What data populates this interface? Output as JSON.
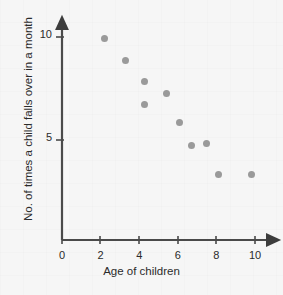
{
  "chart_data": {
    "type": "scatter",
    "title": "",
    "xlabel": "Age of children",
    "ylabel": "No. of times a child falls over in a month",
    "xlim": [
      0,
      11
    ],
    "ylim": [
      0,
      10.6
    ],
    "xticks": [
      0,
      2,
      4,
      6,
      8,
      10
    ],
    "xtick_labels": [
      "0",
      "2",
      "4",
      "6",
      "8",
      "10"
    ],
    "yticks": [
      5,
      10
    ],
    "ytick_labels": [
      "5",
      "10"
    ],
    "grid": false,
    "legend": "none",
    "series": [
      {
        "name": "children",
        "marker": "circle",
        "color": "#9a9a9a",
        "points": [
          {
            "x": 2.2,
            "y": 9.8
          },
          {
            "x": 3.3,
            "y": 8.7
          },
          {
            "x": 4.3,
            "y": 7.7
          },
          {
            "x": 4.3,
            "y": 6.6
          },
          {
            "x": 5.4,
            "y": 7.1
          },
          {
            "x": 6.1,
            "y": 5.7
          },
          {
            "x": 6.7,
            "y": 4.6
          },
          {
            "x": 7.5,
            "y": 4.7
          },
          {
            "x": 8.1,
            "y": 3.2
          },
          {
            "x": 9.8,
            "y": 3.2
          }
        ]
      }
    ],
    "colors": {
      "background": "#f6f6f6",
      "axis": "#4a4a4a",
      "text": "#2b2b2b",
      "marker": "#9a9a9a"
    }
  }
}
